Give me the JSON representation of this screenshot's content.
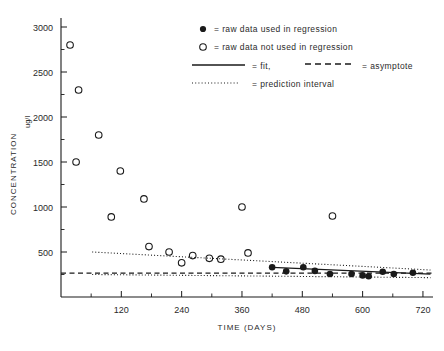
{
  "chart_data": {
    "type": "scatter",
    "title": "",
    "xlabel": "TIME (DAYS)",
    "ylabel": "CONCENTRATION",
    "yunit": "ug/l",
    "xlim": [
      0,
      740
    ],
    "ylim": [
      0,
      3100
    ],
    "xticks": [
      120,
      240,
      360,
      480,
      600,
      720
    ],
    "xticklabels": [
      "120",
      "240",
      "360",
      "480",
      "600",
      "720"
    ],
    "yticks": [
      500,
      1000,
      1500,
      2000,
      2500,
      3000
    ],
    "yticklabels": [
      "500",
      "1000",
      "1500",
      "2000",
      "2500",
      "3000"
    ],
    "grid": false,
    "series": [
      {
        "name": "raw data not used in regression",
        "marker": "open-circle",
        "points": [
          {
            "x": 18,
            "y": 2800
          },
          {
            "x": 30,
            "y": 1500
          },
          {
            "x": 35,
            "y": 2300
          },
          {
            "x": 75,
            "y": 1800
          },
          {
            "x": 100,
            "y": 890
          },
          {
            "x": 118,
            "y": 1400
          },
          {
            "x": 165,
            "y": 1090
          },
          {
            "x": 175,
            "y": 560
          },
          {
            "x": 215,
            "y": 500
          },
          {
            "x": 240,
            "y": 380
          },
          {
            "x": 262,
            "y": 460
          },
          {
            "x": 295,
            "y": 430
          },
          {
            "x": 318,
            "y": 420
          },
          {
            "x": 360,
            "y": 1000
          },
          {
            "x": 372,
            "y": 490
          },
          {
            "x": 540,
            "y": 900
          }
        ]
      },
      {
        "name": "raw data used in regression",
        "marker": "filled-circle",
        "points": [
          {
            "x": 420,
            "y": 330
          },
          {
            "x": 448,
            "y": 285
          },
          {
            "x": 482,
            "y": 330
          },
          {
            "x": 505,
            "y": 290
          },
          {
            "x": 535,
            "y": 255
          },
          {
            "x": 578,
            "y": 255
          },
          {
            "x": 600,
            "y": 240
          },
          {
            "x": 612,
            "y": 230
          },
          {
            "x": 640,
            "y": 280
          },
          {
            "x": 662,
            "y": 255
          },
          {
            "x": 700,
            "y": 270
          }
        ]
      }
    ],
    "fit": {
      "name": "fit",
      "style": "solid",
      "x": [
        420,
        735
      ],
      "y": [
        330,
        255
      ]
    },
    "asymptote": {
      "name": "asymptote",
      "style": "dashed",
      "value": 265
    },
    "prediction_interval": {
      "name": "prediction interval",
      "style": "dotted",
      "upper": {
        "x": [
          62,
          735
        ],
        "y": [
          500,
          300
        ]
      },
      "lower": {
        "x": [
          62,
          735
        ],
        "y": [
          250,
          215
        ]
      }
    }
  },
  "legend": {
    "position": "top-right",
    "entries": [
      {
        "marker": "filled-circle",
        "text": "= raw data used in regression"
      },
      {
        "marker": "open-circle",
        "text": "= raw data not used in regression"
      },
      {
        "marker": "solid-line",
        "text": "= fit,"
      },
      {
        "marker": "dashed-line",
        "text": "= asymptote"
      },
      {
        "marker": "dotted-line",
        "text": "= prediction interval"
      }
    ]
  },
  "caption": ""
}
